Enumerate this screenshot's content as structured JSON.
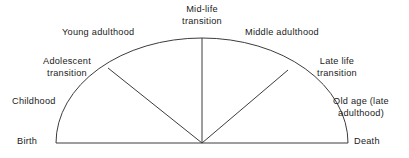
{
  "diagram": {
    "type": "life-stage-arc",
    "background_color": "#ffffff",
    "stroke_color": "#3c3c3c",
    "text_color": "#1a1a1a",
    "labels": {
      "midlife_transition": "Mid-life\ntransition",
      "midlife_transition_line1": "Mid-life",
      "midlife_transition_line2": "transition",
      "young_adulthood": "Young adulthood",
      "middle_adulthood": "Middle adulthood",
      "adolescent_transition_line1": "Adolescent",
      "adolescent_transition_line2": "transition",
      "late_life_transition_line1": "Late life",
      "late_life_transition_line2": "transition",
      "childhood": "Childhood",
      "old_age_line1": "Old age (late",
      "old_age_line2": "adulthood)",
      "birth": "Birth",
      "death": "Death"
    },
    "geometry": {
      "center_x": 202,
      "center_y": 143,
      "radius_x": 146,
      "radius_y": 105,
      "baseline_left_x": 56,
      "baseline_right_x": 348,
      "baseline_y": 143,
      "apex_x": 202,
      "apex_y": 38,
      "left_spoke_end_x": 108,
      "left_spoke_end_y": 68,
      "right_spoke_end_x": 288,
      "right_spoke_end_y": 70
    }
  }
}
